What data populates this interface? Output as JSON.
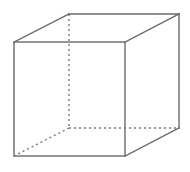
{
  "figure": {
    "type": "cube-wireframe",
    "colors": {
      "solid_edge": "#6b6b6b",
      "hidden_edge": "#7a7a7a",
      "background": "#ffffff"
    },
    "front_face": {
      "x1": 14,
      "y1": 42,
      "x2": 125,
      "y2": 156
    },
    "back_face": {
      "x1": 69,
      "y1": 14,
      "x2": 179,
      "y2": 128
    },
    "solid_edges": [
      {
        "name": "top-left-receding-edge",
        "from": [
          14,
          42
        ],
        "to": [
          69,
          14
        ]
      },
      {
        "name": "back-top-edge",
        "from": [
          69,
          14
        ],
        "to": [
          179,
          14
        ]
      },
      {
        "name": "top-right-receding-edge",
        "from": [
          125,
          42
        ],
        "to": [
          179,
          14
        ]
      },
      {
        "name": "back-right-edge",
        "from": [
          179,
          14
        ],
        "to": [
          179,
          128
        ]
      },
      {
        "name": "bottom-right-receding-edge",
        "from": [
          125,
          156
        ],
        "to": [
          179,
          128
        ]
      }
    ],
    "hidden_edges": [
      {
        "name": "back-left-edge",
        "from": [
          69,
          14
        ],
        "to": [
          69,
          128
        ]
      },
      {
        "name": "back-bottom-edge",
        "from": [
          69,
          128
        ],
        "to": [
          179,
          128
        ]
      },
      {
        "name": "bottom-left-receding-edge",
        "from": [
          69,
          128
        ],
        "to": [
          14,
          156
        ]
      }
    ]
  }
}
